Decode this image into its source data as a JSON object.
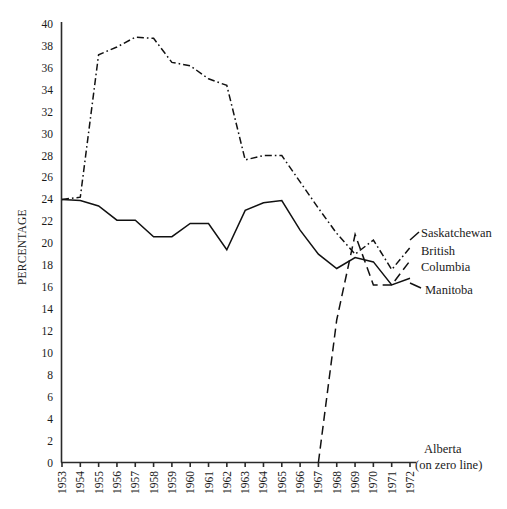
{
  "chart_data": {
    "type": "line",
    "title": "",
    "xlabel": "",
    "ylabel": "PERCENTAGE",
    "ylim": [
      0,
      40
    ],
    "ytick_step": 2,
    "yticks": [
      "40",
      "38",
      "36",
      "34",
      "32",
      "30",
      "28",
      "26",
      "24",
      "22",
      "20",
      "18",
      "16",
      "14",
      "12",
      "10",
      "8",
      "6",
      "4",
      "2",
      "0"
    ],
    "grid": false,
    "legend_position": "right-inline",
    "categories": [
      "1953",
      "1954",
      "1955",
      "1956",
      "1957",
      "1958",
      "1959",
      "1960",
      "1961",
      "1962",
      "1963",
      "1964",
      "1965",
      "1966",
      "1967",
      "1968",
      "1969",
      "1970",
      "1971",
      "1972"
    ],
    "series": [
      {
        "name": "Saskatchewan",
        "style": "dash-dot",
        "color": "#111111",
        "label_text": "Saskatchewan",
        "values": [
          24.0,
          24.2,
          37.2,
          37.9,
          38.8,
          38.7,
          36.5,
          36.2,
          35.0,
          34.4,
          27.6,
          28.0,
          28.0,
          25.6,
          23.2,
          20.9,
          19.0,
          20.3,
          17.6,
          19.6
        ]
      },
      {
        "name": "Manitoba",
        "style": "solid",
        "color": "#111111",
        "label_text": "Manitoba",
        "values": [
          24.0,
          23.9,
          23.4,
          22.1,
          22.1,
          20.6,
          20.6,
          21.8,
          21.8,
          19.4,
          23.0,
          23.7,
          23.9,
          21.2,
          19.0,
          17.7,
          18.7,
          18.3,
          16.2,
          16.8
        ]
      },
      {
        "name": "British Columbia",
        "style": "dashed",
        "color": "#111111",
        "label_text_line1": "British",
        "label_text_line2": "Columbia",
        "values": [
          null,
          null,
          null,
          null,
          null,
          null,
          null,
          null,
          null,
          null,
          null,
          null,
          null,
          null,
          0.0,
          13.0,
          20.8,
          16.2,
          16.2,
          18.4
        ]
      },
      {
        "name": "Alberta",
        "style": "zero-line",
        "color": "#111111",
        "label_text_line1": "Alberta",
        "label_text_line2": "(on zero line)",
        "values": [
          0,
          0,
          0,
          0,
          0,
          0,
          0,
          0,
          0,
          0,
          0,
          0,
          0,
          0,
          0,
          0,
          0,
          0,
          0,
          0
        ]
      }
    ]
  }
}
